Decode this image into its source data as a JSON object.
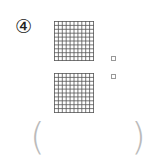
{
  "problem": {
    "number_label": "④",
    "grids": [
      {
        "rows": 10,
        "cols": 10
      },
      {
        "rows": 10,
        "cols": 10
      }
    ],
    "markers": [
      "□",
      "□"
    ],
    "answer": {
      "open_paren": "(",
      "close_paren": ")",
      "value": ""
    }
  },
  "colors": {
    "grid_line": "#555555",
    "paren": "#bbbbbb"
  }
}
